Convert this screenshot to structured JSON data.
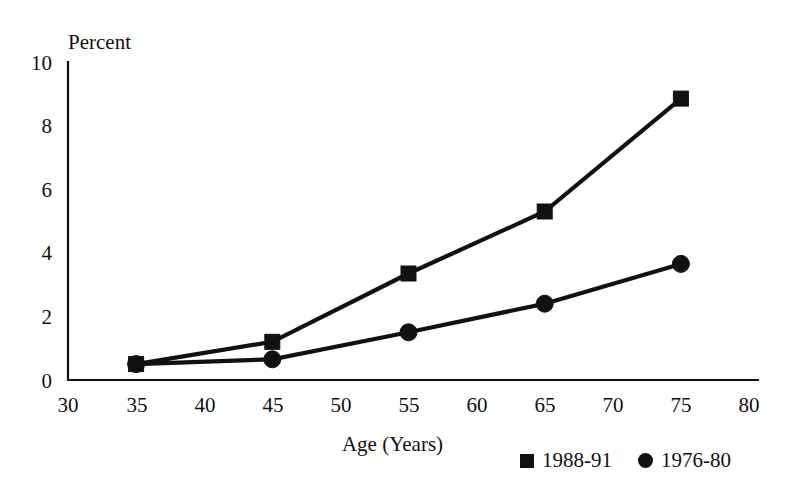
{
  "chart_data": {
    "type": "line",
    "title": "",
    "xlabel": "Age (Years)",
    "ylabel": "Percent",
    "xlim": [
      30,
      80
    ],
    "ylim": [
      0,
      10
    ],
    "xticks": [
      "30",
      "35",
      "40",
      "45",
      "50",
      "55",
      "60",
      "65",
      "70",
      "75",
      "80"
    ],
    "yticks": [
      "0",
      "2",
      "4",
      "6",
      "8",
      "10"
    ],
    "grid": false,
    "legend_position": "bottom-right",
    "x": [
      35,
      45,
      55,
      65,
      75
    ],
    "series": [
      {
        "name": "1988-91",
        "marker": "square",
        "values": [
          0.5,
          1.2,
          3.35,
          5.3,
          8.85
        ]
      },
      {
        "name": "1976-80",
        "marker": "circle",
        "values": [
          0.5,
          0.65,
          1.5,
          2.4,
          3.65
        ]
      }
    ]
  },
  "axes": {
    "y_axis_label": "Percent",
    "x_axis_title": "Age (Years)"
  },
  "legend": {
    "entries": [
      {
        "label": "1988-91",
        "marker": "square-marker"
      },
      {
        "label": "1976-80",
        "marker": "circle-marker"
      }
    ]
  }
}
